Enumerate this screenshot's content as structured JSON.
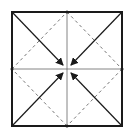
{
  "diagram": {
    "type": "origami-fold-diagram",
    "colors": {
      "outline": "#1a1a1a",
      "crease": "#555555",
      "dashed": "#777777",
      "background": "#ffffff"
    },
    "square": {
      "x1": 12,
      "y1": 12,
      "x2": 122,
      "y2": 126
    },
    "center": {
      "x": 67,
      "y": 69
    },
    "arrows": [
      {
        "name": "top-left-corner-arrow",
        "from": [
          12,
          12
        ],
        "to": [
          64,
          66
        ]
      },
      {
        "name": "top-right-corner-arrow",
        "from": [
          122,
          12
        ],
        "to": [
          70,
          66
        ]
      },
      {
        "name": "bottom-left-corner-arrow",
        "from": [
          12,
          126
        ],
        "to": [
          64,
          72
        ]
      },
      {
        "name": "bottom-right-corner-arrow",
        "from": [
          122,
          126
        ],
        "to": [
          70,
          72
        ]
      }
    ],
    "fold_lines": {
      "valley_dashed": "diamond connecting edge midpoints",
      "creases": "horizontal and vertical center lines"
    }
  }
}
